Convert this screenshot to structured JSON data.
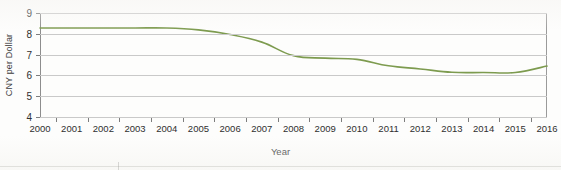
{
  "chart_data": {
    "type": "line",
    "title": "",
    "xlabel": "Year",
    "ylabel": "CNY per Dollar",
    "x": [
      2000,
      2001,
      2002,
      2003,
      2004,
      2005,
      2006,
      2007,
      2008,
      2009,
      2010,
      2011,
      2012,
      2013,
      2014,
      2015,
      2016
    ],
    "categories": [
      "2000",
      "2001",
      "2002",
      "2003",
      "2004",
      "2005",
      "2006",
      "2007",
      "2008",
      "2009",
      "2010",
      "2011",
      "2012",
      "2013",
      "2014",
      "2015",
      "2016"
    ],
    "values": [
      8.28,
      8.28,
      8.28,
      8.28,
      8.28,
      8.19,
      7.97,
      7.6,
      6.95,
      6.83,
      6.77,
      6.46,
      6.31,
      6.15,
      6.14,
      6.14,
      6.45
    ],
    "series": [
      {
        "name": "CNY per Dollar",
        "color": "#7d9b4f",
        "values": [
          8.28,
          8.28,
          8.28,
          8.28,
          8.28,
          8.19,
          7.97,
          7.6,
          6.95,
          6.83,
          6.77,
          6.46,
          6.31,
          6.15,
          6.14,
          6.14,
          6.45
        ]
      }
    ],
    "ylim": [
      4,
      9
    ],
    "xlim": [
      2000,
      2016
    ],
    "y_ticks": [
      4,
      5,
      6,
      7,
      8,
      9
    ],
    "y_tick_labels": [
      "4",
      "5",
      "6",
      "7",
      "8",
      "9"
    ],
    "grid": true,
    "grid_axis": "y",
    "legend": false,
    "legend_position": "none",
    "markers": false,
    "line_color": "#7d9b4f",
    "grid_color": "#c9c9c9",
    "axis_color": "#8d8d8d",
    "background": "#fdfdfc"
  }
}
